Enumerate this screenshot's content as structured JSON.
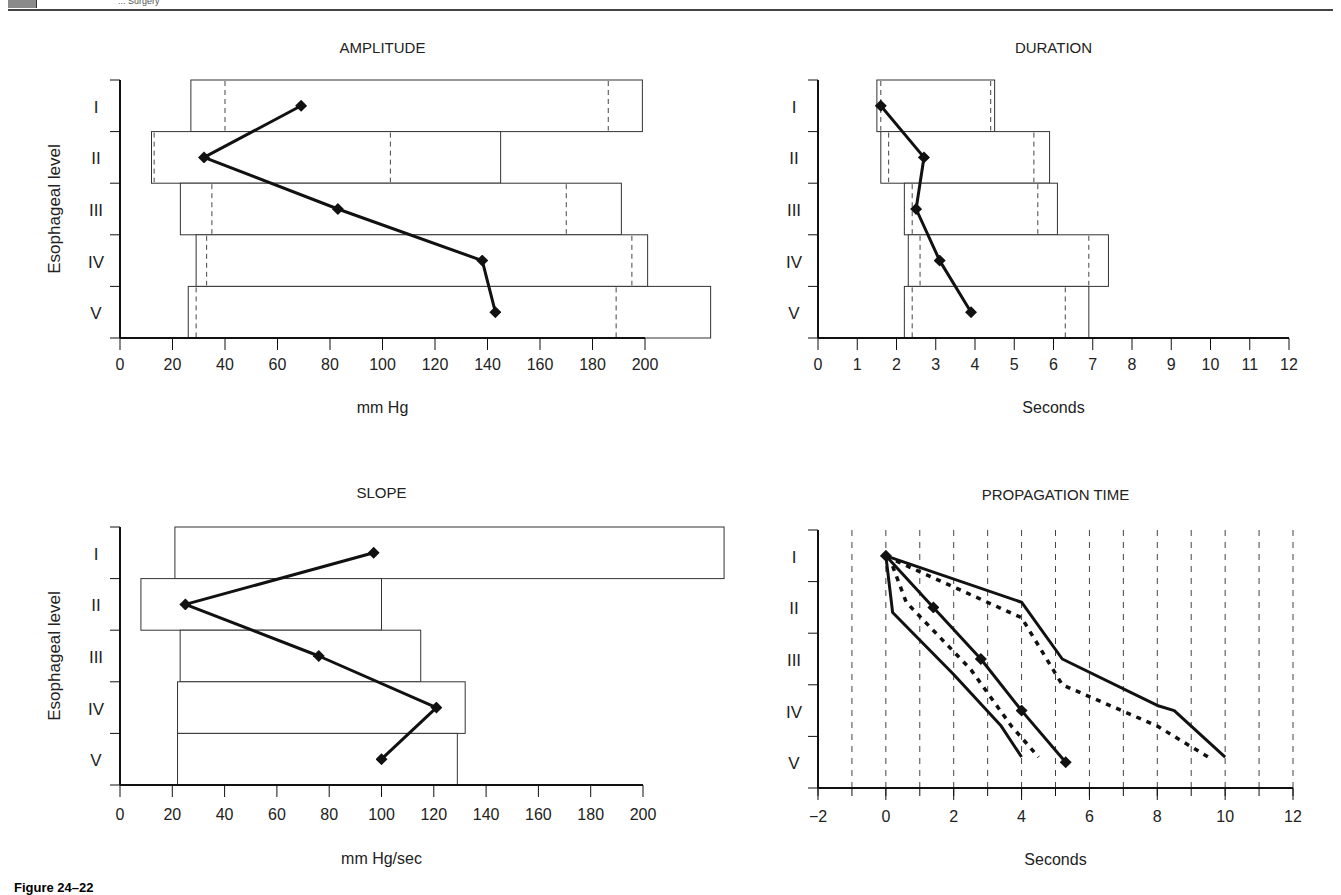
{
  "header": {
    "running_title": "... Surgery"
  },
  "caption": {
    "label": "Figure 24–22"
  },
  "chart_data": [
    {
      "id": "amplitude",
      "type": "bar",
      "title": "AMPLITUDE",
      "xlabel": "mm Hg",
      "ylabel": "Esophageal level",
      "xlim": [
        0,
        200
      ],
      "xticks": [
        0,
        20,
        40,
        60,
        80,
        100,
        120,
        140,
        160,
        180,
        200
      ],
      "categories": [
        "I",
        "II",
        "III",
        "IV",
        "V"
      ],
      "range_bars": [
        {
          "level": "I",
          "min": 27,
          "max": 199
        },
        {
          "level": "II",
          "min": 12,
          "max": 145
        },
        {
          "level": "III",
          "min": 23,
          "max": 191
        },
        {
          "level": "IV",
          "min": 29,
          "max": 201
        },
        {
          "level": "V",
          "min": 26,
          "max": 225
        }
      ],
      "dashed_markers": [
        {
          "level": "I",
          "values": [
            40,
            186
          ]
        },
        {
          "level": "II",
          "values": [
            13,
            103
          ]
        },
        {
          "level": "III",
          "values": [
            35,
            170
          ]
        },
        {
          "level": "IV",
          "values": [
            33,
            195
          ]
        },
        {
          "level": "V",
          "values": [
            29,
            189
          ]
        }
      ],
      "series": [
        {
          "name": "Mean",
          "values": [
            69,
            32,
            83,
            138,
            143
          ]
        }
      ]
    },
    {
      "id": "duration",
      "type": "bar",
      "title": "DURATION",
      "xlabel": "Seconds",
      "ylabel": "",
      "xlim": [
        0,
        12
      ],
      "xticks": [
        0,
        1,
        2,
        3,
        4,
        5,
        6,
        7,
        8,
        9,
        10,
        11,
        12
      ],
      "categories": [
        "I",
        "II",
        "III",
        "IV",
        "V"
      ],
      "range_bars": [
        {
          "level": "I",
          "min": 1.5,
          "max": 4.5
        },
        {
          "level": "II",
          "min": 1.6,
          "max": 5.9
        },
        {
          "level": "III",
          "min": 2.2,
          "max": 6.1
        },
        {
          "level": "IV",
          "min": 2.3,
          "max": 7.4
        },
        {
          "level": "V",
          "min": 2.2,
          "max": 6.9
        }
      ],
      "dashed_markers": [
        {
          "level": "I",
          "values": [
            1.6,
            4.4
          ]
        },
        {
          "level": "II",
          "values": [
            1.8,
            5.5
          ]
        },
        {
          "level": "III",
          "values": [
            2.4,
            5.6
          ]
        },
        {
          "level": "IV",
          "values": [
            2.6,
            6.9
          ]
        },
        {
          "level": "V",
          "values": [
            2.4,
            6.3
          ]
        }
      ],
      "series": [
        {
          "name": "Mean",
          "values": [
            1.6,
            2.7,
            2.5,
            3.1,
            3.9
          ]
        }
      ]
    },
    {
      "id": "slope",
      "type": "bar",
      "title": "SLOPE",
      "xlabel": "mm Hg/sec",
      "ylabel": "Esophageal level",
      "xlim": [
        0,
        200
      ],
      "xticks": [
        0,
        20,
        40,
        60,
        80,
        100,
        120,
        140,
        160,
        180,
        200
      ],
      "categories": [
        "I",
        "II",
        "III",
        "IV",
        "V"
      ],
      "range_bars": [
        {
          "level": "I",
          "min": 21,
          "max": 231
        },
        {
          "level": "II",
          "min": 8,
          "max": 100
        },
        {
          "level": "III",
          "min": 23,
          "max": 115
        },
        {
          "level": "IV",
          "min": 22,
          "max": 132
        },
        {
          "level": "V",
          "min": 22,
          "max": 129
        }
      ],
      "series": [
        {
          "name": "Mean",
          "values": [
            97,
            25,
            76,
            121,
            100
          ]
        }
      ]
    },
    {
      "id": "propagation",
      "type": "line",
      "title": "PROPAGATION TIME",
      "xlabel": "Seconds",
      "ylabel": "",
      "xlim": [
        -2,
        12
      ],
      "xticks": [
        -2,
        0,
        2,
        4,
        6,
        8,
        10,
        12
      ],
      "minor_ticks": 1,
      "grid": "vertical dashed every 1 s",
      "categories": [
        "I",
        "II",
        "III",
        "IV",
        "V"
      ],
      "series": [
        {
          "name": "Mean",
          "style": "solid-markers",
          "points": [
            [
              0,
              0.5
            ],
            [
              1.4,
              1.5
            ],
            [
              2.8,
              2.5
            ],
            [
              4.0,
              3.5
            ],
            [
              5.3,
              4.5
            ]
          ]
        },
        {
          "name": "Upper bound",
          "style": "solid",
          "points": [
            [
              0,
              0.5
            ],
            [
              4,
              1.4
            ],
            [
              5.2,
              2.5
            ],
            [
              8.0,
              3.4
            ],
            [
              8.5,
              3.5
            ],
            [
              10,
              4.4
            ]
          ]
        },
        {
          "name": "Upper inner",
          "style": "dotted",
          "points": [
            [
              0.3,
              0.6
            ],
            [
              4,
              1.7
            ],
            [
              5.2,
              3.0
            ],
            [
              8,
              3.8
            ],
            [
              9.5,
              4.4
            ]
          ]
        },
        {
          "name": "Lower inner",
          "style": "dotted",
          "points": [
            [
              0.2,
              0.7
            ],
            [
              0.6,
              1.4
            ],
            [
              2.5,
              2.7
            ],
            [
              3.7,
              3.8
            ],
            [
              4.5,
              4.4
            ]
          ]
        },
        {
          "name": "Lower bound",
          "style": "solid",
          "points": [
            [
              0,
              0.5
            ],
            [
              0.2,
              1.6
            ],
            [
              2.0,
              2.8
            ],
            [
              3.4,
              3.8
            ],
            [
              4.0,
              4.4
            ]
          ]
        }
      ]
    }
  ]
}
